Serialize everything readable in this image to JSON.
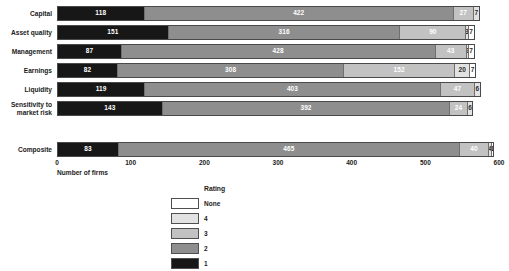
{
  "chart_data": {
    "type": "bar",
    "orientation": "horizontal",
    "stacked": true,
    "title": "",
    "xlabel": "Number of firms",
    "ylabel": "",
    "xlim": [
      0,
      600
    ],
    "xticks": [
      "0",
      "100",
      "200",
      "300",
      "400",
      "500",
      "600"
    ],
    "grid": false,
    "legend": {
      "title": "Rating",
      "position": "bottom-center",
      "entries": [
        {
          "label": "None",
          "color": "#ffffff"
        },
        {
          "label": "4",
          "color": "#e2e2e2"
        },
        {
          "label": "3",
          "color": "#c2c2c2"
        },
        {
          "label": "2",
          "color": "#8e8e8e"
        },
        {
          "label": "1",
          "color": "#171717"
        }
      ]
    },
    "categories": [
      "Capital",
      "Asset quality",
      "Management",
      "Earnings",
      "Liquidity",
      "Sensitivity to\nmarket risk",
      "Composite"
    ],
    "series": [
      {
        "name": "1",
        "values": [
          118,
          151,
          87,
          82,
          119,
          143,
          83
        ]
      },
      {
        "name": "2",
        "values": [
          422,
          316,
          428,
          308,
          403,
          392,
          465
        ]
      },
      {
        "name": "3",
        "values": [
          27,
          90,
          43,
          152,
          47,
          24,
          40
        ]
      },
      {
        "name": "4",
        "values": [
          7,
          3,
          2,
          20,
          6,
          6,
          4
        ]
      },
      {
        "name": "None",
        "values": [
          0,
          7,
          7,
          7,
          0,
          0,
          1
        ]
      }
    ],
    "rows": [
      {
        "category": "Capital",
        "segments": [
          {
            "rating": "1",
            "value": 118,
            "label": "118",
            "show_label": true
          },
          {
            "rating": "2",
            "value": 422,
            "label": "422",
            "show_label": true
          },
          {
            "rating": "3",
            "value": 27,
            "label": "27",
            "show_label": true
          },
          {
            "rating": "4",
            "value": 7,
            "label": "7",
            "show_label": true
          }
        ]
      },
      {
        "category": "Asset quality",
        "segments": [
          {
            "rating": "1",
            "value": 151,
            "label": "151",
            "show_label": true
          },
          {
            "rating": "2",
            "value": 316,
            "label": "316",
            "show_label": true
          },
          {
            "rating": "3",
            "value": 90,
            "label": "90",
            "show_label": true
          },
          {
            "rating": "4",
            "value": 3,
            "label": "3",
            "show_label": true
          },
          {
            "rating": "None",
            "value": 7,
            "label": "7",
            "show_label": true
          }
        ]
      },
      {
        "category": "Management",
        "segments": [
          {
            "rating": "1",
            "value": 87,
            "label": "87",
            "show_label": true
          },
          {
            "rating": "2",
            "value": 428,
            "label": "428",
            "show_label": true
          },
          {
            "rating": "3",
            "value": 43,
            "label": "43",
            "show_label": true
          },
          {
            "rating": "4",
            "value": 2,
            "label": "2",
            "show_label": true
          },
          {
            "rating": "None",
            "value": 7,
            "label": "7",
            "show_label": true
          }
        ]
      },
      {
        "category": "Earnings",
        "segments": [
          {
            "rating": "1",
            "value": 82,
            "label": "82",
            "show_label": true
          },
          {
            "rating": "2",
            "value": 308,
            "label": "308",
            "show_label": true
          },
          {
            "rating": "3",
            "value": 152,
            "label": "152",
            "show_label": true
          },
          {
            "rating": "4",
            "value": 20,
            "label": "20",
            "show_label": true
          },
          {
            "rating": "None",
            "value": 7,
            "label": "7",
            "show_label": true
          }
        ]
      },
      {
        "category": "Liquidity",
        "segments": [
          {
            "rating": "1",
            "value": 119,
            "label": "119",
            "show_label": true
          },
          {
            "rating": "2",
            "value": 403,
            "label": "403",
            "show_label": true
          },
          {
            "rating": "3",
            "value": 47,
            "label": "47",
            "show_label": true
          },
          {
            "rating": "4",
            "value": 6,
            "label": "6",
            "show_label": true
          }
        ]
      },
      {
        "category": "Sensitivity to\nmarket risk",
        "segments": [
          {
            "rating": "1",
            "value": 143,
            "label": "143",
            "show_label": true
          },
          {
            "rating": "2",
            "value": 392,
            "label": "392",
            "show_label": true
          },
          {
            "rating": "3",
            "value": 24,
            "label": "24",
            "show_label": true
          },
          {
            "rating": "4",
            "value": 6,
            "label": "6",
            "show_label": true
          }
        ]
      },
      {
        "category": "Composite",
        "segments": [
          {
            "rating": "1",
            "value": 83,
            "label": "83",
            "show_label": true
          },
          {
            "rating": "2",
            "value": 465,
            "label": "465",
            "show_label": true
          },
          {
            "rating": "3",
            "value": 40,
            "label": "40",
            "show_label": true
          },
          {
            "rating": "4",
            "value": 4,
            "label": "4",
            "show_label": true
          },
          {
            "rating": "None",
            "value": 1,
            "label": "1",
            "show_label": true
          }
        ]
      }
    ]
  }
}
